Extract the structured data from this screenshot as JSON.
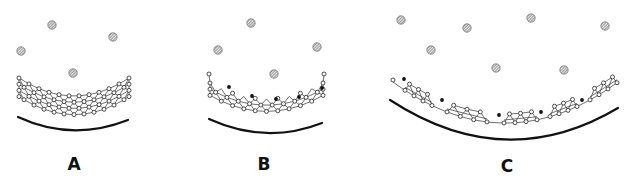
{
  "figure": {
    "width": 631,
    "height": 181,
    "background": "#ffffff",
    "panels": [
      {
        "id": "A",
        "label": "A",
        "label_pos": [
          74,
          170
        ],
        "particles": [
          [
            52,
            25
          ],
          [
            113,
            37
          ],
          [
            21,
            51
          ],
          [
            73,
            73
          ]
        ],
        "particle_radius": 4.2,
        "arc": {
          "x1": 18,
          "y1": 117,
          "cx": 72,
          "cy": 142,
          "x2": 128,
          "y2": 120
        },
        "lattice": {
          "type": "full",
          "x_start": 19,
          "x_end": 129,
          "top_y_edge": 78,
          "top_y_mid": 96,
          "rows": 4,
          "row_gap": 6.2,
          "cols": 12
        },
        "dots": []
      },
      {
        "id": "B",
        "label": "B",
        "label_pos": [
          264,
          170
        ],
        "particles": [
          [
            251,
            23
          ],
          [
            218,
            50
          ],
          [
            317,
            47
          ],
          [
            274,
            74
          ]
        ],
        "particle_radius": 4.2,
        "arc": {
          "x1": 209,
          "y1": 119,
          "cx": 266,
          "cy": 145,
          "x2": 322,
          "y2": 123
        },
        "lattice": {
          "type": "sparse",
          "x_start": 210,
          "x_end": 323,
          "top_y_edge": 83,
          "top_y_mid": 99,
          "rows": 3,
          "row_gap": 6.2,
          "cols": 11
        },
        "dots": [
          [
            229,
            87
          ],
          [
            252,
            96
          ],
          [
            276,
            99
          ],
          [
            299,
            97
          ],
          [
            322,
            88
          ]
        ]
      },
      {
        "id": "C",
        "label": "C",
        "label_pos": [
          507,
          172
        ],
        "particles": [
          [
            401,
            20
          ],
          [
            467,
            28
          ],
          [
            531,
            18
          ],
          [
            605,
            26
          ],
          [
            431,
            50
          ],
          [
            496,
            68
          ],
          [
            564,
            70
          ]
        ],
        "particle_radius": 4.2,
        "arc": {
          "x1": 390,
          "y1": 100,
          "cx": 505,
          "cy": 175,
          "x2": 618,
          "y2": 108
        },
        "lattice": {
          "type": "segmented",
          "chain": {
            "x_start": 393,
            "x_end": 618,
            "y_edge": 82,
            "y_mid": 123
          },
          "segments": [
            {
              "x_start": 405,
              "x_end": 432
            },
            {
              "x_start": 447,
              "x_end": 487
            },
            {
              "x_start": 504,
              "x_end": 537
            },
            {
              "x_start": 550,
              "x_end": 577
            },
            {
              "x_start": 590,
              "x_end": 617
            }
          ],
          "row_gap": 6.0
        },
        "dots": [
          [
            404,
            79
          ],
          [
            442,
            100
          ],
          [
            499,
            115
          ],
          [
            541,
            112
          ],
          [
            582,
            100
          ]
        ]
      }
    ]
  }
}
